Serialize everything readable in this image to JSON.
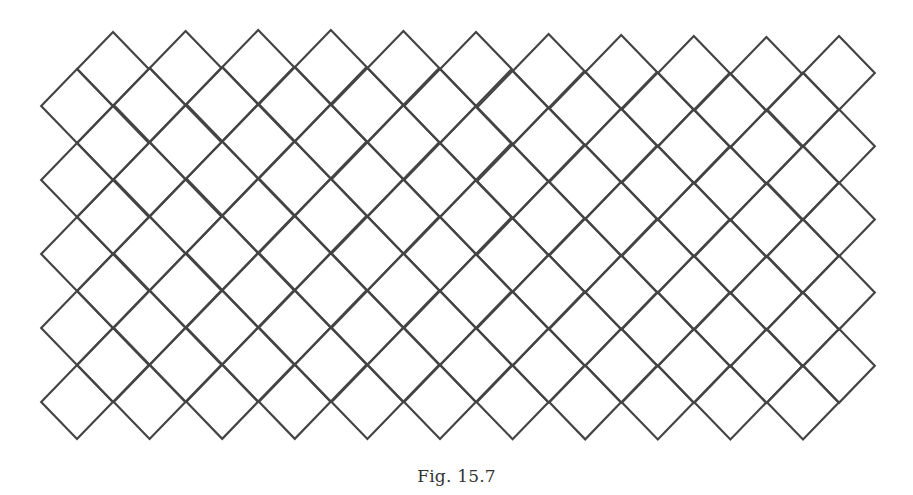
{
  "figure": {
    "caption": "Fig. 15.7",
    "stroke_color": "#444444",
    "stroke_width": 2.2,
    "lattice": {
      "half_width": 35.8,
      "half_height": 37,
      "col_spacing": 72.6,
      "row_spacing": 74,
      "columns": 11,
      "rows": 5,
      "grid_a_origin": [
        113,
        69
      ],
      "grid_b_origin": [
        77,
        106
      ],
      "column_y_drift": [
        0,
        -1,
        -2,
        -2,
        -1,
        0,
        2,
        3,
        4,
        5,
        4
      ]
    }
  }
}
